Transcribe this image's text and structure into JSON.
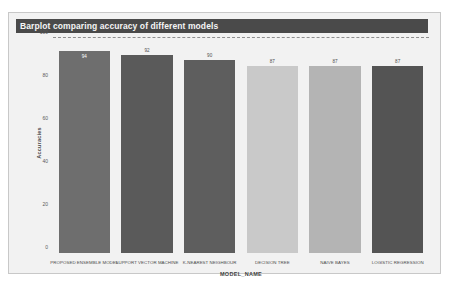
{
  "figure": {
    "background_color": "#f2f2f2",
    "border_color": "#c8c8c8"
  },
  "title": {
    "text": "Barplot comparing accuracy of different models",
    "background_color": "#4a4a4a",
    "text_color": "#f5f5f5"
  },
  "chart_data": {
    "type": "bar",
    "title": "Barplot comparing accuracy of different models",
    "xlabel": "MODEL_NAME",
    "ylabel": "Accuracies",
    "categories": [
      "PROPOSED ENSEMBLE MODEL",
      "SUPPORT VECTOR MACHINE",
      "K-NEAREST NEIGHBOUR",
      "DECISION TREE",
      "NAIVE BAYES",
      "LOGISTIC REGRESSION"
    ],
    "values": [
      94,
      92,
      90,
      87,
      87,
      87
    ],
    "bar_labels": [
      "94",
      "92",
      "90",
      "87",
      "87",
      "87"
    ],
    "bar_colors": [
      "#6e6e6e",
      "#5a5a5a",
      "#5e5e5e",
      "#c9c9c9",
      "#b4b4b4",
      "#545454"
    ],
    "label_placement": [
      "inside",
      "above",
      "above",
      "above",
      "above",
      "above"
    ],
    "ylim": [
      0,
      100
    ],
    "yticks": [
      0,
      20,
      40,
      60,
      80,
      100
    ],
    "ytick_labels": [
      "0",
      "20",
      "40",
      "60",
      "80",
      "100"
    ],
    "grid": false,
    "top_dashed_line_at": 100,
    "legend": "none"
  }
}
